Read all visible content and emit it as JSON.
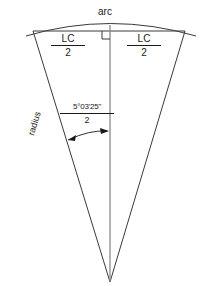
{
  "diagram": {
    "background_color": "#ffffff",
    "stroke_color": "#3a3a3a",
    "text_color": "#1a1a1a",
    "labels": {
      "arc": "arc",
      "half_chord_left_numerator": "LC",
      "half_chord_left_denominator": "2",
      "half_chord_right_numerator": "LC",
      "half_chord_right_denominator": "2",
      "angle_numerator": "5°03'25\"",
      "angle_denominator": "2",
      "radius": "radius"
    },
    "geometry": {
      "apex_x": 110,
      "apex_y": 282,
      "chord_left_x": 33,
      "chord_left_y": 31,
      "chord_right_x": 185,
      "chord_right_y": 31,
      "arc_peak_x": 110,
      "arc_peak_y": 21,
      "arc_left_x": 26,
      "arc_left_y": 36,
      "arc_right_x": 196,
      "arc_right_y": 36,
      "center_line_top_y": 25,
      "right_angle_size": 7
    }
  }
}
